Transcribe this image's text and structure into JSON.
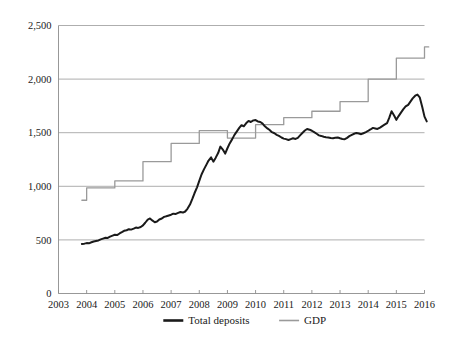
{
  "chart_data": {
    "type": "line",
    "title": "",
    "subtitle": "",
    "xlabel": "",
    "ylabel": "",
    "xlim": [
      2003,
      2016
    ],
    "ylim": [
      0,
      2500
    ],
    "grid": "horizontal",
    "legend_position": "bottom-center",
    "y_ticks": [
      0,
      500,
      1000,
      1500,
      2000,
      2500
    ],
    "y_tick_labels": [
      "0",
      "500",
      "1,000",
      "1,500",
      "2,000",
      "2,500"
    ],
    "x_ticks": [
      2003,
      2004,
      2005,
      2006,
      2007,
      2008,
      2009,
      2010,
      2011,
      2012,
      2013,
      2014,
      2015,
      2016
    ],
    "x_tick_labels": [
      "2003",
      "2004",
      "2005",
      "2006",
      "2007",
      "2008",
      "2009",
      "2010",
      "2011",
      "2012",
      "2013",
      "2014",
      "2015",
      "2016"
    ],
    "series": [
      {
        "name": "Total deposits",
        "color": "#1a1a1a",
        "width": 2.0,
        "style": "line",
        "x": [
          2003.83,
          2003.92,
          2004.0,
          2004.08,
          2004.17,
          2004.25,
          2004.33,
          2004.42,
          2004.5,
          2004.58,
          2004.67,
          2004.75,
          2004.83,
          2004.92,
          2005.0,
          2005.08,
          2005.17,
          2005.25,
          2005.33,
          2005.42,
          2005.5,
          2005.58,
          2005.67,
          2005.75,
          2005.83,
          2005.92,
          2006.0,
          2006.08,
          2006.17,
          2006.25,
          2006.33,
          2006.42,
          2006.5,
          2006.58,
          2006.67,
          2006.75,
          2006.83,
          2006.92,
          2007.0,
          2007.08,
          2007.17,
          2007.25,
          2007.33,
          2007.42,
          2007.5,
          2007.58,
          2007.67,
          2007.75,
          2007.83,
          2007.92,
          2008.0,
          2008.08,
          2008.17,
          2008.25,
          2008.33,
          2008.42,
          2008.5,
          2008.58,
          2008.67,
          2008.75,
          2008.83,
          2008.92,
          2009.0,
          2009.08,
          2009.17,
          2009.25,
          2009.33,
          2009.42,
          2009.5,
          2009.58,
          2009.67,
          2009.75,
          2009.83,
          2009.92,
          2010.0,
          2010.08,
          2010.17,
          2010.25,
          2010.33,
          2010.42,
          2010.5,
          2010.58,
          2010.67,
          2010.75,
          2010.83,
          2010.92,
          2011.0,
          2011.08,
          2011.17,
          2011.25,
          2011.33,
          2011.42,
          2011.5,
          2011.58,
          2011.67,
          2011.75,
          2011.83,
          2011.92,
          2012.0,
          2012.08,
          2012.17,
          2012.25,
          2012.33,
          2012.42,
          2012.5,
          2012.58,
          2012.67,
          2012.75,
          2012.83,
          2012.92,
          2013.0,
          2013.08,
          2013.17,
          2013.25,
          2013.33,
          2013.42,
          2013.5,
          2013.58,
          2013.67,
          2013.75,
          2013.83,
          2013.92,
          2014.0,
          2014.08,
          2014.17,
          2014.25,
          2014.33,
          2014.42,
          2014.5,
          2014.58,
          2014.67,
          2014.75,
          2014.83,
          2014.92,
          2015.0,
          2015.08,
          2015.17,
          2015.25,
          2015.33,
          2015.42,
          2015.5,
          2015.58,
          2015.67,
          2015.75,
          2015.83,
          2015.92,
          2016.0,
          2016.08
        ],
        "values": [
          462,
          465,
          470,
          468,
          478,
          485,
          490,
          495,
          505,
          512,
          520,
          518,
          530,
          540,
          548,
          545,
          560,
          572,
          585,
          590,
          600,
          596,
          605,
          615,
          612,
          620,
          635,
          660,
          690,
          700,
          682,
          665,
          672,
          690,
          700,
          715,
          720,
          728,
          735,
          745,
          742,
          752,
          760,
          755,
          765,
          790,
          830,
          880,
          935,
          990,
          1050,
          1110,
          1160,
          1200,
          1240,
          1270,
          1230,
          1265,
          1310,
          1370,
          1345,
          1305,
          1355,
          1400,
          1440,
          1480,
          1510,
          1545,
          1570,
          1560,
          1590,
          1610,
          1600,
          1615,
          1618,
          1605,
          1600,
          1585,
          1560,
          1540,
          1525,
          1505,
          1495,
          1480,
          1470,
          1455,
          1445,
          1440,
          1432,
          1440,
          1448,
          1442,
          1452,
          1475,
          1500,
          1520,
          1535,
          1528,
          1518,
          1505,
          1490,
          1475,
          1470,
          1462,
          1458,
          1455,
          1450,
          1448,
          1452,
          1455,
          1448,
          1442,
          1440,
          1452,
          1468,
          1480,
          1490,
          1498,
          1492,
          1486,
          1495,
          1505,
          1518,
          1530,
          1545,
          1540,
          1535,
          1548,
          1562,
          1575,
          1590,
          1640,
          1700,
          1660,
          1620,
          1655,
          1690,
          1720,
          1745,
          1760,
          1790,
          1820,
          1845,
          1855,
          1830,
          1740,
          1650,
          1605
        ]
      },
      {
        "name": "GDP",
        "color": "#9a9a9a",
        "width": 1.3,
        "style": "step",
        "x": [
          2003.83,
          2004.0,
          2004.0,
          2005.0,
          2005.0,
          2006.0,
          2006.0,
          2007.0,
          2007.0,
          2008.0,
          2008.0,
          2009.0,
          2009.0,
          2010.0,
          2010.0,
          2011.0,
          2011.0,
          2012.0,
          2012.0,
          2013.0,
          2013.0,
          2014.0,
          2014.0,
          2015.0,
          2015.0,
          2016.0,
          2016.0,
          2016.15
        ],
        "values": [
          870,
          870,
          985,
          985,
          1050,
          1050,
          1230,
          1230,
          1400,
          1400,
          1520,
          1520,
          1450,
          1450,
          1575,
          1575,
          1640,
          1640,
          1700,
          1700,
          1790,
          1790,
          2000,
          2000,
          2195,
          2195,
          2300,
          2300
        ],
        "annual_levels": [
          {
            "year": 2004,
            "value": 870
          },
          {
            "year": 2005,
            "value": 985
          },
          {
            "year": 2006,
            "value": 1050
          },
          {
            "year": 2007,
            "value": 1230
          },
          {
            "year": 2008,
            "value": 1400
          },
          {
            "year": 2009,
            "value": 1520
          },
          {
            "year": 2010,
            "value": 1450
          },
          {
            "year": 2011,
            "value": 1575
          },
          {
            "year": 2012,
            "value": 1640
          },
          {
            "year": 2013,
            "value": 1700
          },
          {
            "year": 2014,
            "value": 1790
          },
          {
            "year": 2015,
            "value": 2000
          },
          {
            "year": 2016,
            "value": 2195
          },
          {
            "year": 2017,
            "value": 2300
          }
        ]
      }
    ],
    "legend": [
      {
        "label": "Total deposits",
        "color": "#1a1a1a",
        "width": 2.6
      },
      {
        "label": "GDP",
        "color": "#9a9a9a",
        "width": 1.6
      }
    ]
  },
  "colors": {
    "background": "#ffffff",
    "axis": "#8c8c8c",
    "grid": "#999999",
    "deposits": "#1a1a1a",
    "gdp": "#9a9a9a",
    "text": "#1a1a1a"
  }
}
